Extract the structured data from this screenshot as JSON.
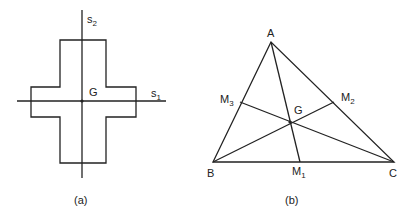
{
  "figure_a": {
    "caption": "(a)",
    "axis_vertical": {
      "name": "s",
      "sub": "2"
    },
    "axis_horizontal": {
      "name": "s",
      "sub": "1"
    },
    "centroid": "G"
  },
  "figure_b": {
    "caption": "(b)",
    "vertices": {
      "A": "A",
      "B": "B",
      "C": "C"
    },
    "midpoints": {
      "M1": {
        "name": "M",
        "sub": "1"
      },
      "M2": {
        "name": "M",
        "sub": "2"
      },
      "M3": {
        "name": "M",
        "sub": "3"
      }
    },
    "centroid": "G"
  },
  "colors": {
    "line": "#222222",
    "background": "#ffffff"
  }
}
